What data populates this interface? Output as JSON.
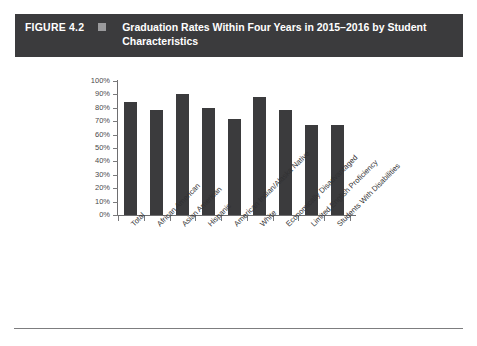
{
  "figure": {
    "number": "FIGURE 4.2",
    "title": "Graduation Rates Within Four Years in 2015–2016 by Student Characteristics",
    "header_bg": "#3b3b3d",
    "header_text_color": "#ffffff",
    "marker": "square-marker"
  },
  "chart_data": {
    "type": "bar",
    "title": "Graduation Rates Within Four Years in 2015–2016 by Student Characteristics",
    "xlabel": "",
    "ylabel": "",
    "ylim": [
      0,
      100
    ],
    "grid": false,
    "legend": "none",
    "bar_color": "#3b3b3d",
    "y_tick_labels": [
      "0%",
      "10%",
      "20%",
      "30%",
      "40%",
      "50%",
      "60%",
      "70%",
      "80%",
      "90%",
      "100%"
    ],
    "y_tick_values": [
      0,
      10,
      20,
      30,
      40,
      50,
      60,
      70,
      80,
      90,
      100
    ],
    "categories": [
      "Total",
      "African American",
      "Asian American",
      "Hispanic",
      "American Indian/Alaska Native",
      "White",
      "Economically Disadvantaged",
      "Limited English Proficiency",
      "Students With Disabilities"
    ],
    "values": [
      84,
      78,
      90,
      80,
      72,
      88,
      78,
      67,
      67
    ]
  }
}
